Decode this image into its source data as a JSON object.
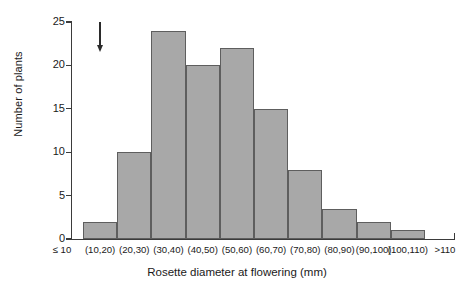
{
  "chart_data": {
    "type": "bar",
    "title": "",
    "xlabel": "Rosette diameter at flowering (mm)",
    "ylabel": "Number of plants",
    "categories": [
      "≤ 10",
      "(10,20)",
      "(20,30)",
      "(30,40)",
      "(40,50)",
      "(50,60)",
      "(60,70)",
      "(70,80)",
      "(80,90)",
      "(90,100)",
      "(100,110)",
      ">110"
    ],
    "values": [
      0,
      2,
      10,
      24,
      20,
      22,
      15,
      8,
      3.5,
      2,
      1,
      0
    ],
    "ylim": [
      0,
      25
    ],
    "yticks": [
      0,
      5,
      10,
      15,
      20,
      25
    ],
    "ytick_labels": [
      "0",
      "5",
      "10",
      "15",
      "20",
      "25"
    ],
    "grid": false,
    "legend": null,
    "bar_fill_color": "#a8a8a8",
    "bar_edge_color": "#5e5e5e",
    "axis_color": "#3b3b3b",
    "annotations": [
      {
        "name": "down-arrow",
        "symbol": "↓",
        "at_category": "(10,20)",
        "y_top": 25,
        "y_bottom": 21.5
      }
    ]
  }
}
